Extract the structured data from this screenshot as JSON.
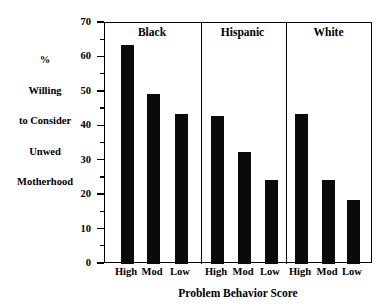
{
  "chart_data": {
    "type": "bar",
    "title": "",
    "xlabel": "Problem Behavior Score",
    "ylabel": "% Willing to Consider Unwed Motherhood",
    "ylabel_lines": [
      "%",
      "Willing",
      "to Consider",
      "Unwed",
      "Motherhood"
    ],
    "ylim": [
      0,
      70
    ],
    "ytick_labels": [
      "0",
      "10",
      "20",
      "30",
      "40",
      "50",
      "60",
      "70"
    ],
    "ytick_values": [
      0,
      10,
      20,
      30,
      40,
      50,
      60,
      70
    ],
    "yminor_values": [
      5,
      15,
      25,
      35,
      45,
      55,
      65
    ],
    "grid": false,
    "legend": "none",
    "bar_color": "#0a0a0a",
    "categories": [
      "High",
      "Mod",
      "Low"
    ],
    "panels": [
      {
        "name": "Black",
        "bars": [
          {
            "label": "High",
            "value": 63.5
          },
          {
            "label": "Mod",
            "value": 49.5
          },
          {
            "label": "Low",
            "value": 43.5
          }
        ]
      },
      {
        "name": "Hispanic",
        "bars": [
          {
            "label": "High",
            "value": 43.0
          },
          {
            "label": "Mod",
            "value": 32.5
          },
          {
            "label": "Low",
            "value": 24.5
          }
        ]
      },
      {
        "name": "White",
        "bars": [
          {
            "label": "High",
            "value": 43.5
          },
          {
            "label": "Mod",
            "value": 24.5
          },
          {
            "label": "Low",
            "value": 18.5
          }
        ]
      }
    ]
  }
}
